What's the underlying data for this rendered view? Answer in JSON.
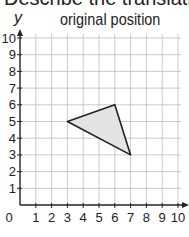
{
  "heading": "Describe the translation",
  "subtitle": "original position",
  "axes": {
    "x_label": "x",
    "y_label": "y",
    "x_ticks": [
      "0",
      "1",
      "2",
      "3",
      "4",
      "5",
      "6",
      "7",
      "8",
      "9",
      "10"
    ],
    "y_ticks": [
      "1",
      "2",
      "3",
      "4",
      "5",
      "6",
      "7",
      "8",
      "9",
      "10"
    ]
  },
  "shape": {
    "type": "triangle",
    "fill": "#e4e4e4",
    "stroke": "#222222",
    "vertices": [
      [
        3,
        5
      ],
      [
        6,
        6
      ],
      [
        7,
        3
      ]
    ]
  },
  "chart_data": {
    "type": "scatter",
    "title": "original position",
    "xlabel": "x",
    "ylabel": "y",
    "xlim": [
      0,
      10
    ],
    "ylim": [
      0,
      10
    ],
    "grid": true,
    "polygon": [
      [
        3,
        5
      ],
      [
        6,
        6
      ],
      [
        7,
        3
      ]
    ]
  }
}
